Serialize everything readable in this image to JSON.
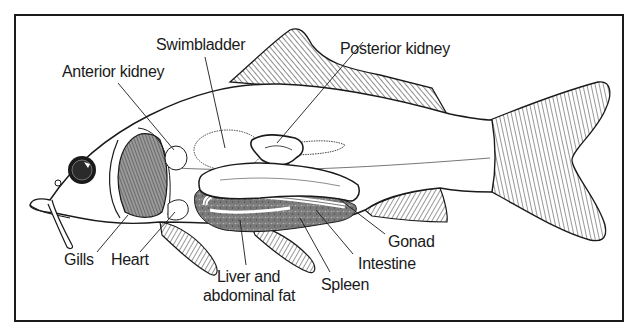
{
  "diagram": {
    "colors": {
      "outline": "#1a1a1a",
      "frame": "#1a1a1a",
      "organ_shade": "#6e6e6e",
      "gill_shade": "#8a8a8a",
      "background": "#ffffff"
    },
    "labels": [
      {
        "id": "swimbladder",
        "text": "Swimbladder"
      },
      {
        "id": "anterior-kidney",
        "text": "Anterior kidney"
      },
      {
        "id": "posterior-kidney",
        "text": "Posterior kidney"
      },
      {
        "id": "gills",
        "text": "Gills"
      },
      {
        "id": "heart",
        "text": "Heart"
      },
      {
        "id": "liver-line1",
        "text": "Liver and"
      },
      {
        "id": "liver-line2",
        "text": "abdominal fat"
      },
      {
        "id": "spleen",
        "text": "Spleen"
      },
      {
        "id": "intestine",
        "text": "Intestine"
      },
      {
        "id": "gonad",
        "text": "Gonad"
      }
    ]
  }
}
